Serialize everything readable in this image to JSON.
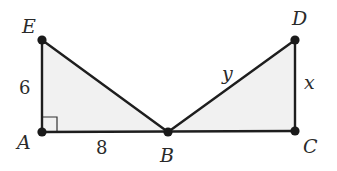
{
  "diagram": {
    "points": {
      "A": {
        "label": "A",
        "x": 42,
        "y": 132
      },
      "B": {
        "label": "B",
        "x": 168,
        "y": 132
      },
      "C": {
        "label": "C",
        "x": 295,
        "y": 131
      },
      "D": {
        "label": "D",
        "x": 295,
        "y": 40
      },
      "E": {
        "label": "E",
        "x": 42,
        "y": 40
      }
    },
    "side_labels": {
      "EA": "6",
      "AB": "8",
      "BD": "y",
      "DC": "x"
    },
    "triangles": [
      {
        "name": "EAB",
        "vertices": [
          "E",
          "A",
          "B"
        ],
        "right_angle_at": "A"
      },
      {
        "name": "DBC",
        "vertices": [
          "D",
          "B",
          "C"
        ]
      }
    ],
    "colors": {
      "fill": "#f1f1f1",
      "stroke": "#1e1e1e"
    }
  }
}
